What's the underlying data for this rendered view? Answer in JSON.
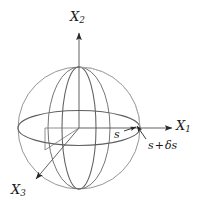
{
  "figure": {
    "type": "3d-sphere-coordinate-diagram",
    "background_color": "#ffffff",
    "line_color": "#6b6b6b",
    "axis_color": "#4a4a4a",
    "text_color": "#1a1a1a",
    "axes": [
      {
        "id": "x1",
        "label_base": "X",
        "label_sub": "1",
        "direction": "right",
        "arrow": true,
        "description": "horizontal axis pointing right"
      },
      {
        "id": "x2",
        "label_base": "X",
        "label_sub": "2",
        "direction": "up",
        "arrow": true,
        "description": "vertical axis pointing up"
      },
      {
        "id": "x3",
        "label_base": "X",
        "label_sub": "3",
        "direction": "down-left",
        "arrow": true,
        "description": "oblique axis pointing toward the lower left, out of the page"
      }
    ],
    "annotations": [
      {
        "id": "radius",
        "text": "s",
        "description": "radius of the unperturbed sphere, arrow pointing right to the sphere surface on the X1 axis"
      },
      {
        "id": "perturbed-radius",
        "base": "s",
        "operator": "+",
        "delta": "δs",
        "text": "s + δs",
        "description": "perturbed radius, arrow pointing up-left to the sphere surface on the X1 axis"
      }
    ],
    "sphere": {
      "center_x": 79,
      "center_y": 128,
      "radius": 61,
      "outline": "great circle silhouette",
      "meridians": 2,
      "equators": 1
    }
  }
}
